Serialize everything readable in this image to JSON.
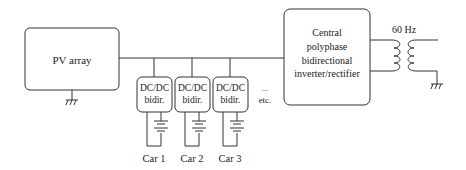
{
  "diagram": {
    "pv_array": {
      "label": "PV array"
    },
    "converters": [
      {
        "line1": "DC/DC",
        "line2": "bidir.",
        "car": "Car 1"
      },
      {
        "line1": "DC/DC",
        "line2": "bidir.",
        "car": "Car 2"
      },
      {
        "line1": "DC/DC",
        "line2": "bidir.",
        "car": "Car 3"
      }
    ],
    "ellipsis": "...",
    "etc": "etc.",
    "central": {
      "lines": [
        "Central",
        "polyphase",
        "bidirectional",
        "inverter/rectifier"
      ]
    },
    "transformer": {
      "label": "60 Hz"
    },
    "colors": {
      "stroke": "#333333",
      "text": "#222222"
    }
  }
}
